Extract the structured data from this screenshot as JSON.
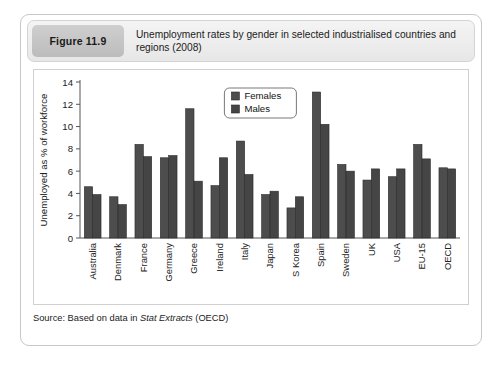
{
  "figure": {
    "number_label": "Figure 11.9",
    "title": "Unemployment rates by gender in selected industrialised countries and regions (2008)",
    "source_prefix": "Source: Based on data in ",
    "source_italic": "Stat Extracts",
    "source_suffix": " (OECD)"
  },
  "colors": {
    "females_bar": "#4d4d4d",
    "males_bar": "#454545",
    "bar_stroke": "#2b2b2b",
    "axis": "#555555",
    "card_border": "#c8c8c8",
    "header_chip": "#c4c4c4",
    "plot_background": "#ffffff"
  },
  "chart_data": {
    "type": "bar",
    "title": "Unemployment rates by gender in selected industrialised countries and regions (2008)",
    "xlabel": "",
    "ylabel": "Unemployed as % of workforce",
    "ylim": [
      0,
      14
    ],
    "yticks": [
      0,
      2,
      4,
      6,
      8,
      10,
      12,
      14
    ],
    "ytick_labels": [
      "0",
      "2",
      "4",
      "6",
      "8",
      "10",
      "12",
      "14"
    ],
    "grid": false,
    "legend_position": "upper center",
    "categories": [
      "Australia",
      "Denmark",
      "France",
      "Germany",
      "Greece",
      "Ireland",
      "Italy",
      "Japan",
      "S Korea",
      "Spain",
      "Sweden",
      "UK",
      "USA",
      "EU-15",
      "OECD"
    ],
    "series": [
      {
        "name": "Females",
        "values": [
          4.6,
          3.7,
          8.4,
          7.2,
          11.6,
          4.7,
          8.7,
          3.9,
          2.7,
          13.1,
          6.6,
          5.2,
          5.5,
          8.4,
          6.3
        ]
      },
      {
        "name": "Males",
        "values": [
          3.9,
          3.0,
          7.3,
          7.4,
          5.1,
          7.2,
          5.7,
          4.2,
          3.7,
          10.2,
          6.0,
          6.2,
          6.2,
          7.1,
          6.2
        ]
      }
    ]
  }
}
